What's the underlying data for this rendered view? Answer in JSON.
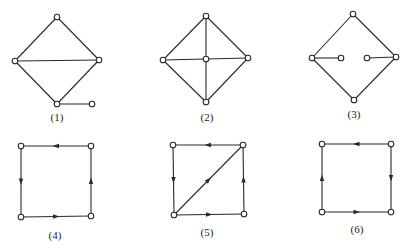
{
  "graphs": [
    {
      "id": "1",
      "label": "(1)",
      "directed": false,
      "label_pos": [
        57,
        121
      ],
      "nodes": {
        "top": [
          57,
          17
        ],
        "left": [
          15,
          61
        ],
        "right": [
          99,
          60
        ],
        "bottom": [
          57,
          104
        ],
        "pendant": [
          92,
          104
        ]
      },
      "edges": [
        [
          "top",
          "left"
        ],
        [
          "top",
          "right"
        ],
        [
          "left",
          "right"
        ],
        [
          "left",
          "bottom"
        ],
        [
          "right",
          "bottom"
        ],
        [
          "bottom",
          "pendant"
        ]
      ]
    },
    {
      "id": "2",
      "label": "(2)",
      "directed": false,
      "label_pos": [
        207,
        121
      ],
      "nodes": {
        "top": [
          206,
          16
        ],
        "left": [
          163,
          60
        ],
        "center": [
          206,
          59
        ],
        "right": [
          248,
          58
        ],
        "bottom": [
          206,
          102
        ]
      },
      "edges": [
        [
          "top",
          "left"
        ],
        [
          "top",
          "right"
        ],
        [
          "left",
          "bottom"
        ],
        [
          "right",
          "bottom"
        ],
        [
          "top",
          "center"
        ],
        [
          "center",
          "bottom"
        ],
        [
          "left",
          "center"
        ],
        [
          "center",
          "right"
        ]
      ]
    },
    {
      "id": "3",
      "label": "(3)",
      "directed": false,
      "label_pos": [
        354,
        118
      ],
      "nodes": {
        "top": [
          353,
          14
        ],
        "left": [
          312,
          58
        ],
        "right": [
          396,
          57
        ],
        "bottom": [
          354,
          100
        ],
        "inner_left": [
          341,
          58
        ],
        "inner_right": [
          367,
          58
        ]
      },
      "edges": [
        [
          "top",
          "left"
        ],
        [
          "top",
          "right"
        ],
        [
          "left",
          "bottom"
        ],
        [
          "right",
          "bottom"
        ],
        [
          "left",
          "inner_left"
        ],
        [
          "inner_right",
          "right"
        ]
      ]
    },
    {
      "id": "4",
      "label": "(4)",
      "directed": true,
      "label_pos": [
        55,
        239
      ],
      "nodes": {
        "tl": [
          21,
          146
        ],
        "tr": [
          91,
          146
        ],
        "bl": [
          21,
          217
        ],
        "br": [
          91,
          216
        ]
      },
      "edges": [
        [
          "tr",
          "tl"
        ],
        [
          "tl",
          "bl"
        ],
        [
          "bl",
          "br"
        ],
        [
          "br",
          "tr"
        ]
      ]
    },
    {
      "id": "5",
      "label": "(5)",
      "directed": true,
      "label_pos": [
        207,
        236
      ],
      "nodes": {
        "tl": [
          173,
          145
        ],
        "tr": [
          243,
          145
        ],
        "bl": [
          174,
          215
        ],
        "br": [
          244,
          214
        ]
      },
      "edges": [
        [
          "tr",
          "tl"
        ],
        [
          "tl",
          "bl"
        ],
        [
          "bl",
          "tr"
        ],
        [
          "bl",
          "br"
        ],
        [
          "br",
          "tr"
        ]
      ]
    },
    {
      "id": "6",
      "label": "(6)",
      "directed": true,
      "label_pos": [
        357,
        233
      ],
      "nodes": {
        "tl": [
          322,
          144
        ],
        "tr": [
          391,
          144
        ],
        "bl": [
          322,
          212
        ],
        "br": [
          391,
          212
        ]
      },
      "edges": [
        [
          "tr",
          "tl"
        ],
        [
          "tr",
          "br"
        ],
        [
          "bl",
          "tl"
        ],
        [
          "bl",
          "br"
        ]
      ]
    }
  ]
}
